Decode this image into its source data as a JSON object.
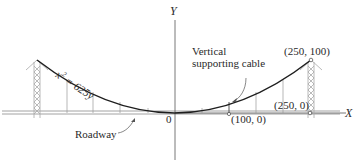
{
  "diagram": {
    "axes": {
      "x_label": "X",
      "y_label": "Y",
      "origin_label": "0"
    },
    "curve": {
      "equation": "x² = 625y",
      "equation_text": "x",
      "equation_sup": "2",
      "equation_rest": " = 625y"
    },
    "points": {
      "tower_top": "(250, 100)",
      "tower_base": "(250, 0)",
      "cable_foot": "(100, 0)"
    },
    "annotations": {
      "vertical_cable_line1": "Vertical",
      "vertical_cable_line2": "supporting cable",
      "roadway": "Roadway"
    },
    "colors": {
      "ink": "#2a2a2a",
      "light_ink": "#9a9a9a",
      "background": "#ffffff"
    }
  }
}
